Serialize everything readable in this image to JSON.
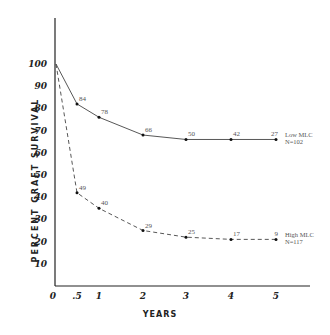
{
  "chart_data": {
    "type": "line",
    "title": "",
    "xlabel": "YEARS",
    "ylabel": "PERCENT GRAFT SURVIVAL",
    "x_ticks": [
      "0",
      ".5",
      "1",
      "2",
      "3",
      "4",
      "5"
    ],
    "y_ticks": [
      "10",
      "20",
      "30",
      "40",
      "50",
      "60",
      "70",
      "80",
      "90",
      "100"
    ],
    "xlim": [
      0,
      5
    ],
    "ylim": [
      0,
      100
    ],
    "grid": false,
    "legend_position": "right, inline at series end",
    "series": [
      {
        "name": "Low MLC",
        "legend": [
          "Low MLC",
          "N=102"
        ],
        "style": "solid",
        "x": [
          0,
          0.5,
          1,
          2,
          3,
          4,
          5
        ],
        "y": [
          100,
          82,
          76,
          68,
          66,
          66,
          66
        ],
        "point_labels": [
          "",
          "84",
          "78",
          "66",
          "50",
          "42",
          "27"
        ]
      },
      {
        "name": "High MLC",
        "legend": [
          "High MLC",
          "N=117"
        ],
        "style": "dashed",
        "x": [
          0,
          0.5,
          1,
          2,
          3,
          4,
          5
        ],
        "y": [
          100,
          42,
          35,
          25,
          22,
          21,
          21
        ],
        "point_labels": [
          "",
          "49",
          "40",
          "29",
          "25",
          "17",
          "9"
        ]
      }
    ]
  }
}
